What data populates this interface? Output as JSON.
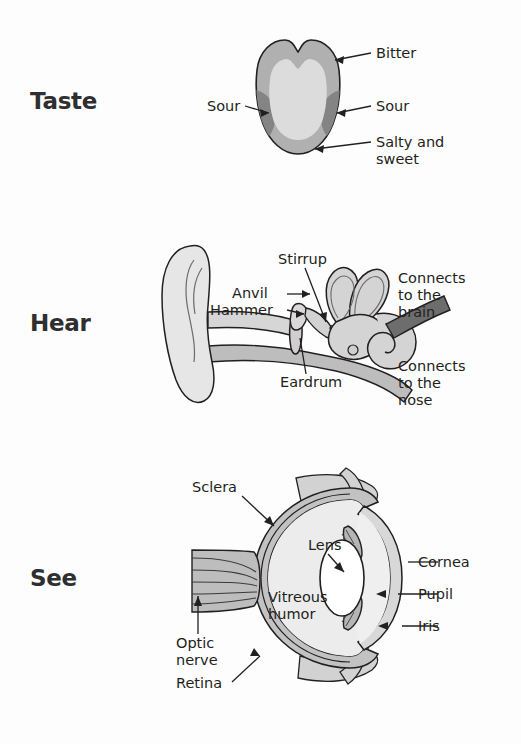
{
  "document": {
    "title": "The Senses: Taste, Hear, See",
    "background_color": "#ffffff",
    "text_color": "#231f20"
  },
  "palette": {
    "outline": "#231f20",
    "light_gray": "#e3e3e3",
    "mid_gray": "#b3b3b3",
    "dark_gray": "#8c8c8c",
    "darker_gray": "#6e6e6e",
    "white": "#ffffff",
    "nerve_dark": "#5a5a5a"
  },
  "sections": [
    {
      "id": "taste",
      "heading": "Taste",
      "figure": "tongue-taste-map"
    },
    {
      "id": "hear",
      "heading": "Hear",
      "figure": "ear-cross-section"
    },
    {
      "id": "see",
      "heading": "See",
      "figure": "eye-cross-section"
    }
  ],
  "taste": {
    "heading": "Taste",
    "labels": {
      "bitter": "Bitter",
      "sour_left": "Sour",
      "sour_right": "Sour",
      "salty_and_sweet_line1": "Salty and",
      "salty_and_sweet_line2": "sweet"
    }
  },
  "hear": {
    "heading": "Hear",
    "labels": {
      "stirrup": "Stirrup",
      "anvil": "Anvil",
      "hammer": "Hammer",
      "eardrum": "Eardrum",
      "brain_line1": "Connects",
      "brain_line2": "to the",
      "brain_line3": "brain",
      "nose_line1": "Connects",
      "nose_line2": "to the",
      "nose_line3": "nose"
    }
  },
  "see": {
    "heading": "See",
    "labels": {
      "sclera": "Sclera",
      "lens": "Lens",
      "cornea": "Cornea",
      "pupil": "Pupil",
      "iris": "Iris",
      "vitreous_line1": "Vitreous",
      "vitreous_line2": "humor",
      "optic_nerve_line1": "Optic",
      "optic_nerve_line2": "nerve",
      "retina": "Retina"
    }
  }
}
